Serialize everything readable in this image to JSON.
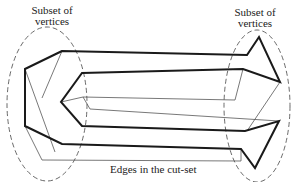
{
  "labels": {
    "left_subset": {
      "line1": "Subset of",
      "line2": "vertices"
    },
    "right_subset": {
      "line1": "Subset of",
      "line2": "vertices"
    },
    "cut_set": "Edges in the cut-set"
  },
  "colors": {
    "thick_edge": "#1a1a1a",
    "thin_edge": "#555555",
    "ellipse": "#444444",
    "text": "#222222"
  }
}
